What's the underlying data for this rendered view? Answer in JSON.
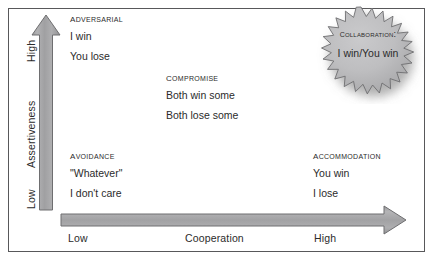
{
  "diagram": {
    "type": "conflict-resolution-grid",
    "vertical_axis": {
      "name": "Assertiveness",
      "high_label": "High",
      "low_label": "Low"
    },
    "horizontal_axis": {
      "name": "Cooperation",
      "low_label": "Low",
      "high_label": "High"
    },
    "quadrants": [
      {
        "id": "adversarial",
        "title": "Adversarial",
        "lines": [
          "I win",
          "You lose"
        ]
      },
      {
        "id": "compromise",
        "title": "Compromise",
        "lines": [
          "Both win some",
          "Both lose some"
        ]
      },
      {
        "id": "avoidance",
        "title": "Avoidance",
        "lines": [
          "\"Whatever\"",
          "I don't care"
        ]
      },
      {
        "id": "accommodation",
        "title": "Accommodation",
        "lines": [
          "You win",
          "I lose"
        ]
      }
    ],
    "callout": {
      "id": "collaboration",
      "title": "Collaboration:",
      "line": "I win/You win",
      "shape": "starburst"
    },
    "colors": {
      "arrow_fill": "#a3a3a5",
      "arrow_stroke": "#6e6e70",
      "burst_fill": "#bcbcbe",
      "burst_stroke": "#6e6e70",
      "frame_stroke": "#58585a",
      "text": "#2b2b2b",
      "background": "#ffffff"
    }
  }
}
